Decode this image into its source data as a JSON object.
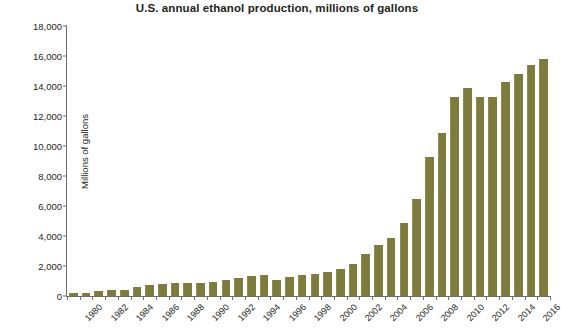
{
  "chart_data": {
    "type": "bar",
    "title": "U.S. annual ethanol production, millions of gallons",
    "xlabel": "",
    "ylabel": "Millions of gallons",
    "ylim": [
      0,
      18000
    ],
    "ytick_labels": [
      "18,000",
      "16,000",
      "14,000",
      "12,000",
      "10,000",
      "8,000",
      "6,000",
      "4,000",
      "2,000",
      "0"
    ],
    "ytick_values": [
      18000,
      16000,
      14000,
      12000,
      10000,
      8000,
      6000,
      4000,
      2000,
      0
    ],
    "grid": false,
    "legend": "none",
    "bar_color": "#7d7c3c",
    "axis_color": "#6e6e6e",
    "xtick_labels": [
      "1980",
      "1982",
      "1984",
      "1986",
      "1988",
      "1990",
      "1992",
      "1994",
      "1996",
      "1998",
      "2000",
      "2002",
      "2004",
      "2006",
      "2008",
      "2010",
      "2012",
      "2014",
      "2016"
    ],
    "categories": [
      "1980",
      "1981",
      "1982",
      "1983",
      "1984",
      "1985",
      "1986",
      "1987",
      "1988",
      "1989",
      "1990",
      "1991",
      "1992",
      "1993",
      "1994",
      "1995",
      "1996",
      "1997",
      "1998",
      "1999",
      "2000",
      "2001",
      "2002",
      "2003",
      "2004",
      "2005",
      "2006",
      "2007",
      "2008",
      "2009",
      "2010",
      "2011",
      "2012",
      "2013",
      "2014",
      "2015",
      "2016",
      "2017"
    ],
    "values": [
      175,
      215,
      350,
      375,
      430,
      610,
      710,
      830,
      845,
      870,
      900,
      950,
      1100,
      1200,
      1350,
      1400,
      1100,
      1300,
      1400,
      1470,
      1630,
      1770,
      2130,
      2800,
      3400,
      3900,
      4900,
      6500,
      9300,
      10900,
      13300,
      13900,
      13300,
      13300,
      14300,
      14800,
      15400,
      15800
    ]
  }
}
